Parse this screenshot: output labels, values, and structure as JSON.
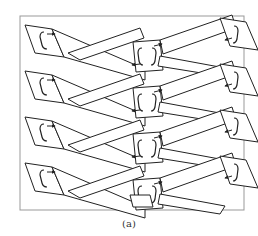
{
  "figure": {
    "caption": "(a)",
    "rows": 4,
    "stroke_color": "#222222",
    "fill_color": "#ffffff",
    "frame_color": "#999999"
  }
}
